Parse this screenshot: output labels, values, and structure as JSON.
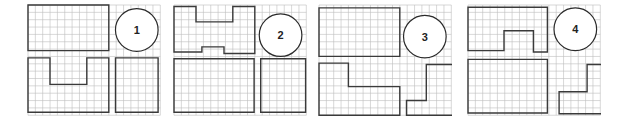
{
  "figure": {
    "cell_px": 7.35,
    "colors": {
      "grid": "#bdbdbd",
      "outline": "#3a3a3a",
      "background": "#ffffff"
    }
  },
  "panels": [
    {
      "label": "1",
      "left": 27,
      "cols": 18,
      "rows": 15,
      "badge": {
        "col": 14.8,
        "row": 3.4,
        "r": 2.9
      },
      "shapes": [
        {
          "name": "top-rectangle",
          "points": [
            [
              0,
              0
            ],
            [
              11,
              0
            ],
            [
              11,
              6.2
            ],
            [
              0,
              6.2
            ]
          ]
        },
        {
          "name": "u-shape",
          "points": [
            [
              0,
              7.2
            ],
            [
              3,
              7.2
            ],
            [
              3,
              10.8
            ],
            [
              8,
              10.8
            ],
            [
              8,
              7.2
            ],
            [
              11,
              7.2
            ],
            [
              11,
              14.6
            ],
            [
              0,
              14.6
            ]
          ]
        },
        {
          "name": "square",
          "points": [
            [
              11.9,
              7.2
            ],
            [
              17.7,
              7.2
            ],
            [
              17.7,
              14.6
            ],
            [
              11.9,
              14.6
            ]
          ]
        }
      ]
    },
    {
      "label": "2",
      "left": 173,
      "cols": 18,
      "rows": 15,
      "badge": {
        "col": 14.5,
        "row": 4.1,
        "r": 2.9
      },
      "shapes": [
        {
          "name": "h-shape",
          "points": [
            [
              0,
              0.2
            ],
            [
              3,
              0.2
            ],
            [
              3,
              2.3
            ],
            [
              8,
              2.3
            ],
            [
              8,
              0.2
            ],
            [
              11,
              0.2
            ],
            [
              11,
              6.6
            ],
            [
              6.8,
              6.6
            ],
            [
              6.8,
              5.7
            ],
            [
              3.8,
              5.7
            ],
            [
              3.8,
              6.4
            ],
            [
              0,
              6.4
            ]
          ]
        },
        {
          "name": "large-rectangle",
          "points": [
            [
              0,
              7.3
            ],
            [
              10.9,
              7.3
            ],
            [
              10.9,
              14.6
            ],
            [
              0,
              14.6
            ]
          ]
        },
        {
          "name": "square",
          "points": [
            [
              11.8,
              7.3
            ],
            [
              17.9,
              7.3
            ],
            [
              17.9,
              14.6
            ],
            [
              11.8,
              14.6
            ]
          ]
        }
      ]
    },
    {
      "label": "3",
      "left": 318,
      "cols": 18,
      "rows": 15,
      "badge": {
        "col": 14.4,
        "row": 4.3,
        "r": 2.9
      },
      "shapes": [
        {
          "name": "top-rectangle",
          "points": [
            [
              0,
              0.4
            ],
            [
              11,
              0.4
            ],
            [
              11,
              7
            ],
            [
              0,
              7
            ]
          ]
        },
        {
          "name": "l-shape-left",
          "points": [
            [
              0,
              7.9
            ],
            [
              4,
              7.9
            ],
            [
              4,
              11.1
            ],
            [
              11,
              11.1
            ],
            [
              11,
              15
            ],
            [
              0,
              15
            ]
          ]
        },
        {
          "name": "l-shape-right",
          "points": [
            [
              14.6,
              8.1
            ],
            [
              18.2,
              8.1
            ],
            [
              18.2,
              15
            ],
            [
              11.9,
              15
            ],
            [
              11.9,
              13
            ],
            [
              14.6,
              13
            ]
          ]
        }
      ]
    },
    {
      "label": "4",
      "left": 467,
      "cols": 18,
      "rows": 15,
      "badge": {
        "col": 14.6,
        "row": 3.3,
        "r": 2.9
      },
      "shapes": [
        {
          "name": "notched-rectangle",
          "points": [
            [
              0,
              0.3
            ],
            [
              10.8,
              0.3
            ],
            [
              10.8,
              6.4
            ],
            [
              8.9,
              6.4
            ],
            [
              8.9,
              3.5
            ],
            [
              4.9,
              3.5
            ],
            [
              4.9,
              6.2
            ],
            [
              0,
              6.2
            ]
          ]
        },
        {
          "name": "large-rectangle",
          "points": [
            [
              0,
              7.4
            ],
            [
              10.8,
              7.4
            ],
            [
              10.8,
              14.7
            ],
            [
              0,
              14.7
            ]
          ]
        },
        {
          "name": "l-shape",
          "points": [
            [
              16.2,
              8.1
            ],
            [
              18.2,
              8.1
            ],
            [
              18.2,
              14.8
            ],
            [
              12.4,
              14.8
            ],
            [
              12.4,
              11.8
            ],
            [
              16.2,
              11.8
            ]
          ]
        }
      ]
    }
  ]
}
